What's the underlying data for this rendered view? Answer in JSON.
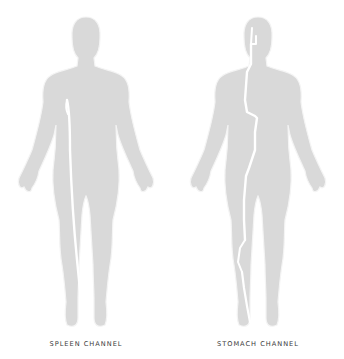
{
  "figures": [
    {
      "id": "spleen",
      "caption": "SPLEEN CHANNEL"
    },
    {
      "id": "stomach",
      "caption": "STOMACH CHANNEL"
    }
  ],
  "colors": {
    "body_fill": "#d9d9d9",
    "outline": "#f4f4f4",
    "channel": "#ffffff",
    "caption": "#3a3a3a",
    "background": "#ffffff"
  }
}
